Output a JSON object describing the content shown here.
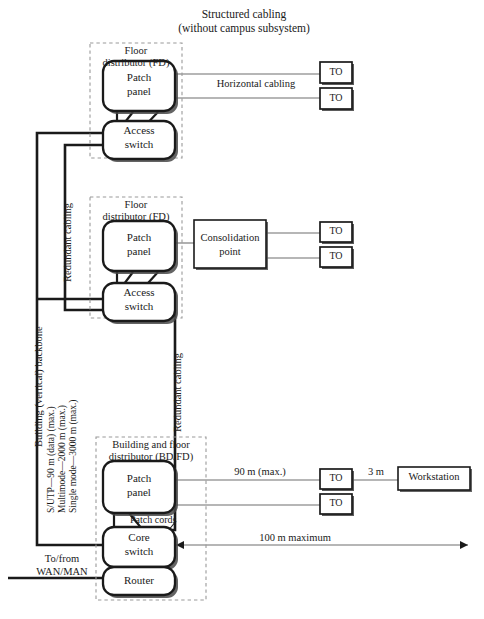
{
  "figure": {
    "title_line1": "Structured cabling",
    "title_line2": "(without campus subsystem)"
  },
  "groups": {
    "fd_top": {
      "label_line1": "Floor",
      "label_line2": "distributor (FD)"
    },
    "fd_mid": {
      "label_line1": "Floor",
      "label_line2": "distributor (FD)"
    },
    "bdfd": {
      "label_line1": "Building and floor",
      "label_line2": "distributor (BD/FD)"
    }
  },
  "nodes": {
    "patch_panel_top": {
      "line1": "Patch",
      "line2": "panel"
    },
    "access_switch_top": {
      "line1": "Access",
      "line2": "switch"
    },
    "patch_panel_mid": {
      "line1": "Patch",
      "line2": "panel"
    },
    "access_switch_mid": {
      "line1": "Access",
      "line2": "switch"
    },
    "patch_panel_bot": {
      "line1": "Patch",
      "line2": "panel"
    },
    "core_switch": {
      "line1": "Core",
      "line2": "switch"
    },
    "router": {
      "line1": "Router",
      "line2": ""
    },
    "consolidation_point": {
      "line1": "Consolidation",
      "line2": "point"
    },
    "workstation": {
      "line1": "Workstation",
      "line2": ""
    }
  },
  "outlets": {
    "label": "TO",
    "items": [
      "TO",
      "TO",
      "TO",
      "TO",
      "TO",
      "TO"
    ]
  },
  "link_labels": {
    "horizontal_cabling": "Horizontal cabling",
    "redundant_cabling_left": "Redundant cabling",
    "redundant_cabling_right": "Redundant cabling",
    "backbone": "Building (vertical) backbone",
    "backbone_spec_1": "S/UTP—90 m (data) (max.)",
    "backbone_spec_2": "Multimode—2000 m (max.)",
    "backbone_spec_3": "Single mode—3000 m (max.)",
    "distance_90m": "90 m (max.)",
    "distance_3m": "3 m",
    "distance_100m": "100 m maximum",
    "patch_cords": "Patch cords",
    "wan_man_line1": "To/from",
    "wan_man_line2": "WAN/MAN"
  },
  "colors": {
    "stroke": "#1a1a1a",
    "thin_stroke": "#6f6f6f",
    "dashed": "#9a9a9a",
    "background": "#ffffff",
    "shadow": "#4a4a4a"
  }
}
